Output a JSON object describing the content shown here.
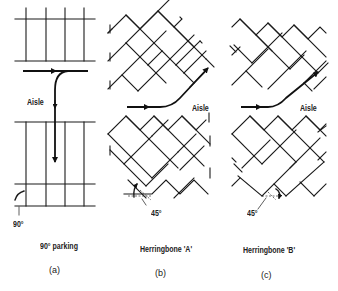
{
  "figure": {
    "panels": [
      {
        "id": "a",
        "title": "90° parking",
        "letter": "(a)",
        "aisle_label": "Aisle",
        "angle_label": "90°"
      },
      {
        "id": "b",
        "title": "Herringbone 'A'",
        "letter": "(b)",
        "aisle_label": "Aisle",
        "angle_label": "45°"
      },
      {
        "id": "c",
        "title": "Herringbone 'B'",
        "letter": "(c)",
        "aisle_label": "Aisle",
        "angle_label": "45°"
      }
    ],
    "colors": {
      "line": "#1a1a1a",
      "background": "#ffffff"
    }
  }
}
